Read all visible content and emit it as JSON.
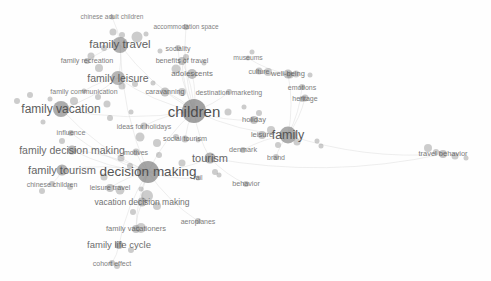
{
  "visualization": {
    "type": "bibliometric-term-co-occurrence-network",
    "background_color": "#fefefe",
    "node_color": "#7d7d7d",
    "label_color": "#4a4a4a",
    "edge_color": "#d8d8d8"
  },
  "chart_data": {
    "type": "scatter",
    "title": "",
    "xlabel": "",
    "ylabel": "",
    "grid": false,
    "legend": "none",
    "nodes": [
      {
        "label": "chinese adult children",
        "x": 112,
        "y": 17,
        "size": 5,
        "font": 6.5,
        "weight": 0.3,
        "lx": 112,
        "ly": 17
      },
      {
        "label": "accommodation space",
        "x": 186,
        "y": 27,
        "size": 6,
        "font": 6.5,
        "weight": 0.34,
        "lx": 186,
        "ly": 27
      },
      {
        "label": "family travel",
        "x": 120,
        "y": 45,
        "size": 16,
        "font": 11.5,
        "weight": 0.72,
        "lx": 120,
        "ly": 45
      },
      {
        "label": "sociality",
        "x": 178,
        "y": 48,
        "size": 6,
        "font": 7,
        "weight": 0.36,
        "lx": 178,
        "ly": 48
      },
      {
        "label": "museums",
        "x": 248,
        "y": 58,
        "size": 5,
        "font": 6.8,
        "weight": 0.3,
        "lx": 248,
        "ly": 58
      },
      {
        "label": "family recreation",
        "x": 87,
        "y": 61,
        "size": 6,
        "font": 7.2,
        "weight": 0.38,
        "lx": 87,
        "ly": 61
      },
      {
        "label": "benefits of travel",
        "x": 182,
        "y": 61,
        "size": 8,
        "font": 7.2,
        "weight": 0.42,
        "lx": 182,
        "ly": 61
      },
      {
        "label": "culture",
        "x": 259,
        "y": 71,
        "size": 7,
        "font": 7,
        "weight": 0.36,
        "lx": 259,
        "ly": 71
      },
      {
        "label": "well-being",
        "x": 288,
        "y": 74,
        "size": 9,
        "font": 7.5,
        "weight": 0.44,
        "lx": 288,
        "ly": 74
      },
      {
        "label": "adolescents",
        "x": 192,
        "y": 74,
        "size": 10,
        "font": 7.8,
        "weight": 0.48,
        "lx": 192,
        "ly": 74
      },
      {
        "label": "family leisure",
        "x": 118,
        "y": 78,
        "size": 14,
        "font": 10.5,
        "weight": 0.64,
        "lx": 118,
        "ly": 78
      },
      {
        "label": "emotions",
        "x": 302,
        "y": 87,
        "size": 6,
        "font": 7,
        "weight": 0.36,
        "lx": 302,
        "ly": 87
      },
      {
        "label": "family communication",
        "x": 84,
        "y": 91,
        "size": 5,
        "font": 7,
        "weight": 0.34,
        "lx": 84,
        "ly": 91
      },
      {
        "label": "caravanning",
        "x": 165,
        "y": 92,
        "size": 9,
        "font": 7.2,
        "weight": 0.42,
        "lx": 165,
        "ly": 92
      },
      {
        "label": "destination marketing",
        "x": 229,
        "y": 92,
        "size": 6,
        "font": 7,
        "weight": 0.36,
        "lx": 229,
        "ly": 92
      },
      {
        "label": "heritage",
        "x": 305,
        "y": 98,
        "size": 7,
        "font": 7,
        "weight": 0.38,
        "lx": 305,
        "ly": 98
      },
      {
        "label": "family vacation",
        "x": 61,
        "y": 109,
        "size": 16,
        "font": 12,
        "weight": 0.76,
        "lx": 61,
        "ly": 109
      },
      {
        "label": "children",
        "x": 194,
        "y": 111,
        "size": 24,
        "font": 15,
        "weight": 0.92,
        "lx": 194,
        "ly": 111
      },
      {
        "label": "holiday",
        "x": 254,
        "y": 120,
        "size": 8,
        "font": 7.5,
        "weight": 0.42,
        "lx": 254,
        "ly": 120
      },
      {
        "label": "ideas for holidays",
        "x": 144,
        "y": 126,
        "size": 7,
        "font": 7,
        "weight": 0.38,
        "lx": 144,
        "ly": 126
      },
      {
        "label": "leisure",
        "x": 262,
        "y": 135,
        "size": 8,
        "font": 7.5,
        "weight": 0.42,
        "lx": 262,
        "ly": 135
      },
      {
        "label": "family",
        "x": 288,
        "y": 135,
        "size": 17,
        "font": 12.5,
        "weight": 0.78,
        "lx": 288,
        "ly": 135
      },
      {
        "label": "influence",
        "x": 71,
        "y": 133,
        "size": 6,
        "font": 7.2,
        "weight": 0.36,
        "lx": 71,
        "ly": 133
      },
      {
        "label": "social tourism",
        "x": 185,
        "y": 139,
        "size": 7,
        "font": 7.2,
        "weight": 0.4,
        "lx": 185,
        "ly": 139
      },
      {
        "label": "family decision making",
        "x": 72,
        "y": 150,
        "size": 9,
        "font": 10.5,
        "weight": 0.62,
        "lx": 72,
        "ly": 150
      },
      {
        "label": "motives",
        "x": 136,
        "y": 152,
        "size": 7,
        "font": 7,
        "weight": 0.38,
        "lx": 136,
        "ly": 152
      },
      {
        "label": "denmark",
        "x": 243,
        "y": 150,
        "size": 6,
        "font": 7.2,
        "weight": 0.36,
        "lx": 243,
        "ly": 150
      },
      {
        "label": "travel behavior",
        "x": 443,
        "y": 154,
        "size": 8,
        "font": 7.5,
        "weight": 0.42,
        "lx": 443,
        "ly": 154
      },
      {
        "label": "tourism",
        "x": 210,
        "y": 158,
        "size": 11,
        "font": 11,
        "weight": 0.66,
        "lx": 210,
        "ly": 158
      },
      {
        "label": "brand",
        "x": 276,
        "y": 157,
        "size": 6,
        "font": 7,
        "weight": 0.34,
        "lx": 276,
        "ly": 157
      },
      {
        "label": "family tourism",
        "x": 62,
        "y": 170,
        "size": 11,
        "font": 11,
        "weight": 0.68,
        "lx": 62,
        "ly": 170
      },
      {
        "label": "decision making",
        "x": 148,
        "y": 172,
        "size": 22,
        "font": 13.5,
        "weight": 0.86,
        "lx": 148,
        "ly": 172
      },
      {
        "label": "rail",
        "x": 198,
        "y": 178,
        "size": 5,
        "font": 6.8,
        "weight": 0.32,
        "lx": 198,
        "ly": 178
      },
      {
        "label": "chinese children",
        "x": 52,
        "y": 184,
        "size": 6,
        "font": 7,
        "weight": 0.36,
        "lx": 52,
        "ly": 184
      },
      {
        "label": "leisure travel",
        "x": 110,
        "y": 188,
        "size": 8,
        "font": 7.2,
        "weight": 0.4,
        "lx": 110,
        "ly": 188
      },
      {
        "label": "behavior",
        "x": 246,
        "y": 184,
        "size": 6,
        "font": 7.2,
        "weight": 0.36,
        "lx": 246,
        "ly": 184
      },
      {
        "label": "vacation decision making",
        "x": 142,
        "y": 202,
        "size": 9,
        "font": 8.5,
        "weight": 0.5,
        "lx": 142,
        "ly": 202
      },
      {
        "label": "aeroplanes",
        "x": 198,
        "y": 221,
        "size": 6,
        "font": 7,
        "weight": 0.36,
        "lx": 198,
        "ly": 221
      },
      {
        "label": "family vacationers",
        "x": 136,
        "y": 229,
        "size": 8,
        "font": 7.5,
        "weight": 0.42,
        "lx": 136,
        "ly": 229
      },
      {
        "label": "family life cycle",
        "x": 119,
        "y": 245,
        "size": 8,
        "font": 9.5,
        "weight": 0.56,
        "lx": 119,
        "ly": 245
      },
      {
        "label": "cohort effect",
        "x": 112,
        "y": 263,
        "size": 6,
        "font": 7,
        "weight": 0.36,
        "lx": 112,
        "ly": 263
      }
    ],
    "extra_nodes": [
      {
        "x": 113,
        "y": 32,
        "size": 7
      },
      {
        "x": 122,
        "y": 35,
        "size": 6
      },
      {
        "x": 137,
        "y": 37,
        "size": 11
      },
      {
        "x": 146,
        "y": 34,
        "size": 5
      },
      {
        "x": 104,
        "y": 48,
        "size": 6
      },
      {
        "x": 91,
        "y": 56,
        "size": 7
      },
      {
        "x": 99,
        "y": 68,
        "size": 8
      },
      {
        "x": 160,
        "y": 51,
        "size": 5
      },
      {
        "x": 186,
        "y": 57,
        "size": 6
      },
      {
        "x": 176,
        "y": 69,
        "size": 9
      },
      {
        "x": 204,
        "y": 63,
        "size": 5
      },
      {
        "x": 252,
        "y": 52,
        "size": 5
      },
      {
        "x": 268,
        "y": 72,
        "size": 8
      },
      {
        "x": 296,
        "y": 74,
        "size": 7
      },
      {
        "x": 310,
        "y": 75,
        "size": 5
      },
      {
        "x": 122,
        "y": 86,
        "size": 7
      },
      {
        "x": 135,
        "y": 84,
        "size": 6
      },
      {
        "x": 153,
        "y": 83,
        "size": 5
      },
      {
        "x": 182,
        "y": 92,
        "size": 8
      },
      {
        "x": 30,
        "y": 95,
        "size": 6
      },
      {
        "x": 17,
        "y": 101,
        "size": 6
      },
      {
        "x": 50,
        "y": 99,
        "size": 5
      },
      {
        "x": 74,
        "y": 101,
        "size": 8
      },
      {
        "x": 98,
        "y": 97,
        "size": 6
      },
      {
        "x": 107,
        "y": 104,
        "size": 7
      },
      {
        "x": 110,
        "y": 118,
        "size": 6
      },
      {
        "x": 131,
        "y": 112,
        "size": 5
      },
      {
        "x": 228,
        "y": 112,
        "size": 7
      },
      {
        "x": 244,
        "y": 107,
        "size": 5
      },
      {
        "x": 259,
        "y": 113,
        "size": 6
      },
      {
        "x": 140,
        "y": 137,
        "size": 9
      },
      {
        "x": 157,
        "y": 143,
        "size": 8
      },
      {
        "x": 176,
        "y": 137,
        "size": 6
      },
      {
        "x": 198,
        "y": 140,
        "size": 5
      },
      {
        "x": 271,
        "y": 130,
        "size": 8
      },
      {
        "x": 297,
        "y": 142,
        "size": 7
      },
      {
        "x": 278,
        "y": 145,
        "size": 6
      },
      {
        "x": 317,
        "y": 141,
        "size": 5
      },
      {
        "x": 43,
        "y": 122,
        "size": 5
      },
      {
        "x": 62,
        "y": 141,
        "size": 6
      },
      {
        "x": 121,
        "y": 158,
        "size": 7
      },
      {
        "x": 130,
        "y": 166,
        "size": 6
      },
      {
        "x": 159,
        "y": 155,
        "size": 6
      },
      {
        "x": 182,
        "y": 163,
        "size": 7
      },
      {
        "x": 215,
        "y": 172,
        "size": 6
      },
      {
        "x": 104,
        "y": 177,
        "size": 7
      },
      {
        "x": 70,
        "y": 187,
        "size": 6
      },
      {
        "x": 42,
        "y": 191,
        "size": 6
      },
      {
        "x": 120,
        "y": 190,
        "size": 9
      },
      {
        "x": 141,
        "y": 189,
        "size": 5
      },
      {
        "x": 147,
        "y": 196,
        "size": 12
      },
      {
        "x": 157,
        "y": 206,
        "size": 8
      },
      {
        "x": 133,
        "y": 212,
        "size": 6
      },
      {
        "x": 141,
        "y": 228,
        "size": 10
      },
      {
        "x": 131,
        "y": 250,
        "size": 6
      },
      {
        "x": 117,
        "y": 266,
        "size": 6
      },
      {
        "x": 428,
        "y": 148,
        "size": 8
      },
      {
        "x": 436,
        "y": 152,
        "size": 6
      },
      {
        "x": 455,
        "y": 156,
        "size": 7
      },
      {
        "x": 466,
        "y": 158,
        "size": 5
      },
      {
        "x": 321,
        "y": 146,
        "size": 5
      },
      {
        "x": 219,
        "y": 175,
        "size": 5
      },
      {
        "x": 302,
        "y": 99,
        "size": 6
      },
      {
        "x": 290,
        "y": 75,
        "size": 7
      }
    ],
    "edges": [
      [
        120,
        45,
        194,
        111
      ],
      [
        120,
        45,
        148,
        172
      ],
      [
        118,
        78,
        194,
        111
      ],
      [
        61,
        109,
        194,
        111
      ],
      [
        61,
        109,
        148,
        172
      ],
      [
        194,
        111,
        148,
        172
      ],
      [
        194,
        111,
        210,
        158
      ],
      [
        194,
        111,
        288,
        135
      ],
      [
        194,
        111,
        192,
        74
      ],
      [
        194,
        111,
        165,
        92
      ],
      [
        194,
        111,
        229,
        92
      ],
      [
        194,
        111,
        254,
        120
      ],
      [
        288,
        135,
        443,
        154
      ],
      [
        210,
        158,
        443,
        154
      ],
      [
        148,
        172,
        142,
        202
      ],
      [
        148,
        172,
        119,
        245
      ],
      [
        148,
        172,
        136,
        229
      ],
      [
        148,
        172,
        110,
        188
      ],
      [
        148,
        172,
        72,
        150
      ],
      [
        148,
        172,
        62,
        170
      ],
      [
        148,
        172,
        210,
        158
      ],
      [
        148,
        172,
        198,
        221
      ],
      [
        148,
        172,
        198,
        178
      ],
      [
        194,
        111,
        185,
        139
      ],
      [
        194,
        111,
        144,
        126
      ],
      [
        120,
        45,
        112,
        17
      ],
      [
        120,
        45,
        87,
        61
      ],
      [
        118,
        78,
        84,
        91
      ],
      [
        288,
        135,
        302,
        87
      ],
      [
        288,
        135,
        288,
        74
      ],
      [
        288,
        135,
        305,
        98
      ],
      [
        288,
        135,
        243,
        150
      ],
      [
        288,
        135,
        276,
        157
      ],
      [
        248,
        58,
        288,
        74
      ],
      [
        259,
        71,
        288,
        74
      ],
      [
        210,
        158,
        246,
        184
      ],
      [
        182,
        61,
        194,
        111
      ],
      [
        178,
        48,
        194,
        111
      ],
      [
        186,
        27,
        194,
        111
      ],
      [
        72,
        150,
        148,
        172
      ],
      [
        71,
        133,
        148,
        172
      ],
      [
        136,
        152,
        148,
        172
      ],
      [
        52,
        184,
        62,
        170
      ],
      [
        112,
        263,
        119,
        245
      ],
      [
        142,
        202,
        136,
        229
      ],
      [
        194,
        111,
        182,
        61
      ],
      [
        118,
        78,
        120,
        45
      ],
      [
        61,
        109,
        118,
        78
      ]
    ]
  }
}
